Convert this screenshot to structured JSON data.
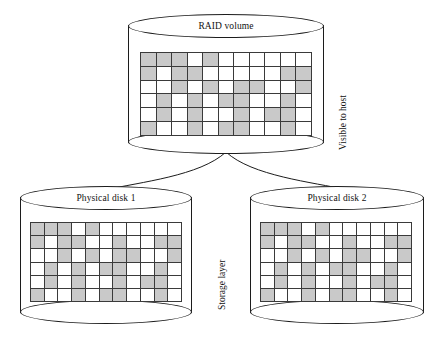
{
  "diagram": {
    "title_raid": "RAID volume",
    "title_disk1": "Physical disk 1",
    "title_disk2": "Physical disk 2",
    "label_visible_to_host": "Visible to host",
    "label_storage_layer": "Storage layer",
    "colors": {
      "stroke": "#1c1c1c",
      "grid_line": "#3a3a3a",
      "cell_filled": "#c9c9c9",
      "cell_empty": "#ffffff",
      "background": "#ffffff"
    }
  },
  "chart_data": {
    "type": "heatmap",
    "grid_cols": 11,
    "grid_rows": 6,
    "legend": [
      {
        "name": "allocated block",
        "color": "#c9c9c9"
      },
      {
        "name": "free block",
        "color": "#ffffff"
      }
    ],
    "panels": [
      {
        "name": "RAID volume",
        "matrix": [
          [
            1,
            1,
            1,
            0,
            1,
            0,
            0,
            0,
            0,
            0,
            0
          ],
          [
            1,
            0,
            1,
            1,
            0,
            0,
            0,
            0,
            0,
            1,
            1
          ],
          [
            0,
            0,
            1,
            0,
            1,
            0,
            1,
            1,
            0,
            0,
            1
          ],
          [
            0,
            1,
            0,
            1,
            0,
            1,
            1,
            0,
            0,
            1,
            0
          ],
          [
            0,
            1,
            0,
            1,
            0,
            0,
            1,
            0,
            1,
            1,
            0
          ],
          [
            1,
            0,
            0,
            1,
            0,
            1,
            1,
            0,
            0,
            1,
            0
          ]
        ]
      },
      {
        "name": "Physical disk 1",
        "matrix": [
          [
            1,
            1,
            1,
            0,
            1,
            0,
            0,
            0,
            0,
            0,
            0
          ],
          [
            1,
            0,
            1,
            1,
            0,
            0,
            1,
            0,
            0,
            1,
            1
          ],
          [
            0,
            0,
            1,
            0,
            1,
            0,
            1,
            1,
            0,
            0,
            1
          ],
          [
            0,
            1,
            0,
            1,
            0,
            1,
            1,
            0,
            0,
            1,
            0
          ],
          [
            0,
            1,
            0,
            1,
            0,
            0,
            1,
            0,
            1,
            1,
            0
          ],
          [
            1,
            0,
            0,
            1,
            0,
            1,
            1,
            0,
            0,
            1,
            0
          ]
        ]
      },
      {
        "name": "Physical disk 2",
        "matrix": [
          [
            1,
            1,
            1,
            0,
            1,
            0,
            0,
            0,
            0,
            0,
            0
          ],
          [
            1,
            0,
            1,
            1,
            0,
            0,
            1,
            0,
            0,
            1,
            1
          ],
          [
            0,
            0,
            1,
            0,
            1,
            0,
            1,
            1,
            0,
            0,
            1
          ],
          [
            0,
            1,
            0,
            1,
            0,
            1,
            1,
            0,
            0,
            1,
            0
          ],
          [
            0,
            1,
            0,
            1,
            0,
            0,
            1,
            0,
            1,
            1,
            0
          ],
          [
            1,
            0,
            0,
            1,
            0,
            1,
            1,
            0,
            0,
            1,
            0
          ]
        ]
      }
    ],
    "connections": [
      {
        "from": "RAID volume",
        "to": "Physical disk 1"
      },
      {
        "from": "RAID volume",
        "to": "Physical disk 2"
      }
    ]
  }
}
